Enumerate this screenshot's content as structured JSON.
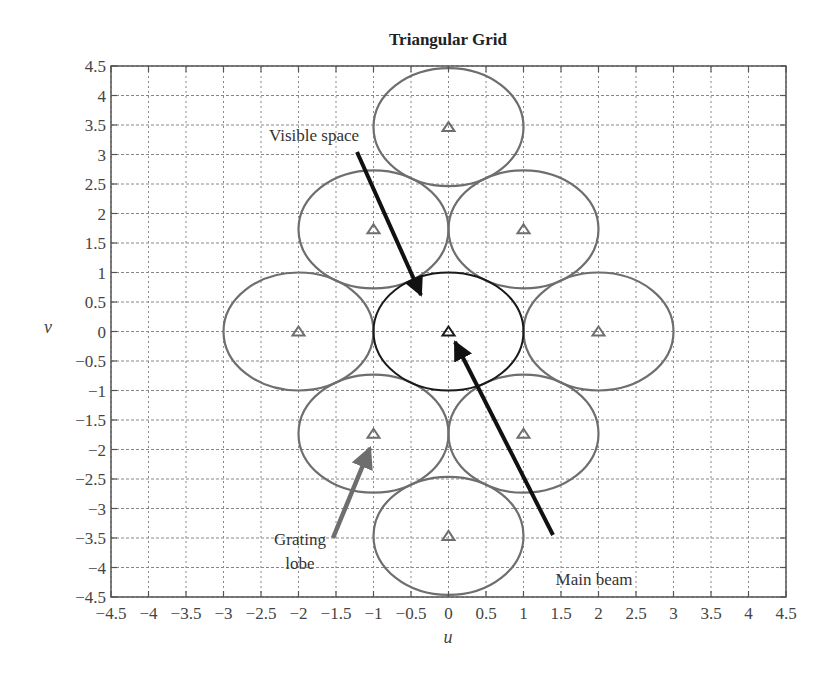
{
  "chart_data": {
    "type": "scatter",
    "title": "Triangular Grid",
    "xlabel": "u",
    "ylabel": "v",
    "xlim": [
      -4.5,
      4.5
    ],
    "ylim": [
      -4.5,
      4.5
    ],
    "grid": true,
    "x_ticks": [
      "-4.5",
      "-4",
      "-3.5",
      "-3",
      "-2.5",
      "-2",
      "-1.5",
      "-1",
      "-0.5",
      "0",
      "0.5",
      "1",
      "1.5",
      "2",
      "2.5",
      "3",
      "3.5",
      "4",
      "4.5"
    ],
    "y_ticks": [
      "-4.5",
      "-4",
      "-3.5",
      "-3",
      "-2.5",
      "-2",
      "-1.5",
      "-1",
      "-0.5",
      "0",
      "0.5",
      "1",
      "1.5",
      "2",
      "2.5",
      "3",
      "3.5",
      "4",
      "4.5"
    ],
    "points": [
      {
        "u": 0,
        "v": 0,
        "kind": "main beam"
      },
      {
        "u": 2,
        "v": 0,
        "kind": "grating lobe"
      },
      {
        "u": -2,
        "v": 0,
        "kind": "grating lobe"
      },
      {
        "u": 1,
        "v": 1.732,
        "kind": "grating lobe"
      },
      {
        "u": -1,
        "v": 1.732,
        "kind": "grating lobe"
      },
      {
        "u": 1,
        "v": -1.732,
        "kind": "grating lobe"
      },
      {
        "u": -1,
        "v": -1.732,
        "kind": "grating lobe"
      },
      {
        "u": 0,
        "v": 3.464,
        "kind": "grating lobe"
      },
      {
        "u": 0,
        "v": -3.464,
        "kind": "grating lobe"
      }
    ],
    "circle_radius": 1,
    "annotations": [
      {
        "text": "Visible space",
        "x": -0.65,
        "y": 3.35,
        "arrow_to": [
          -0.2,
          0.6
        ]
      },
      {
        "text": "Main beam",
        "x": 1.3,
        "y": -3.7,
        "arrow_to": [
          0.05,
          0.0
        ]
      },
      {
        "text": "Grating lobe",
        "x": -1.2,
        "y": -3.6,
        "arrow_to": [
          -0.8,
          -1.75
        ]
      }
    ]
  },
  "colors": {
    "visible_circle": "#1a1a1a",
    "lobe_circle": "#6e6e6e",
    "grid": "#888888",
    "axis": "#555555",
    "arrow_main": "#111111",
    "arrow_lobe": "#6e6e6e"
  }
}
